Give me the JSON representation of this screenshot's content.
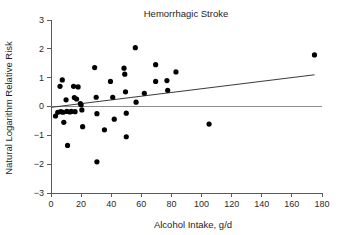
{
  "chart_data": {
    "type": "scatter",
    "title": "Hemorrhagic Stroke",
    "xlabel": "Alcohol Intake, g/d",
    "ylabel": "Natural Logarithm Relative Risk",
    "xlim": [
      0,
      180
    ],
    "ylim": [
      -3,
      3
    ],
    "xticks": [
      0,
      20,
      40,
      60,
      80,
      100,
      120,
      140,
      160,
      180
    ],
    "yticks": [
      -3,
      -2,
      -1,
      0,
      1,
      2,
      3
    ],
    "xtick_labels": [
      "0",
      "20",
      "40",
      "60",
      "80",
      "100",
      "120",
      "140",
      "160",
      "180"
    ],
    "ytick_labels": [
      "−3",
      "−2",
      "−1",
      "0",
      "1",
      "2",
      "3"
    ],
    "grid": false,
    "legend": false,
    "zero_reference_line": true,
    "series": [
      {
        "name": "Studies",
        "marker": "filled-circle",
        "color": "#000000",
        "points": [
          [
            3.0,
            -0.33
          ],
          [
            4.5,
            -0.2
          ],
          [
            6.0,
            0.7
          ],
          [
            6.5,
            -0.18
          ],
          [
            7.5,
            0.92
          ],
          [
            8.0,
            -0.2
          ],
          [
            8.5,
            -0.55
          ],
          [
            10.0,
            0.23
          ],
          [
            10.5,
            -0.17
          ],
          [
            11.0,
            -1.35
          ],
          [
            12.5,
            -0.19
          ],
          [
            13.5,
            -0.17
          ],
          [
            15.0,
            0.7
          ],
          [
            15.5,
            0.31
          ],
          [
            16.0,
            -0.18
          ],
          [
            17.0,
            0.26
          ],
          [
            18.0,
            0.68
          ],
          [
            19.5,
            0.1
          ],
          [
            20.0,
            0.06
          ],
          [
            20.5,
            -0.12
          ],
          [
            21.0,
            -0.7
          ],
          [
            29.0,
            1.35
          ],
          [
            30.0,
            0.32
          ],
          [
            30.5,
            -0.25
          ],
          [
            30.5,
            -1.92
          ],
          [
            35.5,
            -0.81
          ],
          [
            39.5,
            0.87
          ],
          [
            41.0,
            0.32
          ],
          [
            42.0,
            -0.44
          ],
          [
            48.5,
            1.33
          ],
          [
            49.0,
            1.12
          ],
          [
            49.5,
            0.51
          ],
          [
            50.0,
            -0.23
          ],
          [
            50.0,
            -1.05
          ],
          [
            56.0,
            2.04
          ],
          [
            56.5,
            0.15
          ],
          [
            62.0,
            0.46
          ],
          [
            69.5,
            1.45
          ],
          [
            69.5,
            0.87
          ],
          [
            77.0,
            0.9
          ],
          [
            77.5,
            0.56
          ],
          [
            83.0,
            1.2
          ],
          [
            105.0,
            -0.61
          ],
          [
            175.0,
            1.79
          ]
        ]
      }
    ],
    "trend_line": {
      "name": "Linear regression",
      "color": "#3a3a3a",
      "x_start": 0,
      "y_start": -0.03,
      "x_end": 175,
      "y_end": 1.1
    }
  },
  "axes": {
    "title": "Hemorrhagic Stroke",
    "xlabel": "Alcohol Intake, g/d",
    "ylabel": "Natural Logarithm Relative Risk"
  }
}
